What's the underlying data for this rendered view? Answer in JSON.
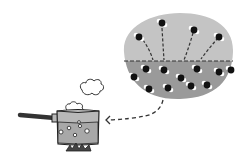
{
  "figure": {
    "colors": {
      "background": "#ffffff",
      "air_region": "#c4c4c4",
      "water_region": "#9a9a9a",
      "pot_body": "#b8b8b8",
      "pot_water": "#a8a8a8",
      "outline": "#222222",
      "molecule_oxygen": "#111111",
      "molecule_hydrogen": "#ffffff",
      "handle": "#333333",
      "flame": "#444444"
    },
    "elements": {
      "pot": "saucepan",
      "steam": "steam puffs",
      "magnified_view": "water surface close-up",
      "arrow": "dashed arrow pointing to pot"
    },
    "counts": {
      "escaping_molecules": 4,
      "liquid_molecules": 11,
      "pot_bubbles": 6
    }
  }
}
